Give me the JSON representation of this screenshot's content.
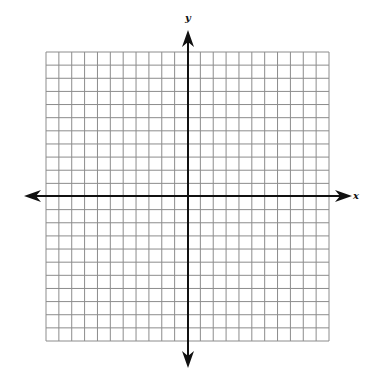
{
  "diagram": {
    "type": "coordinate-plane",
    "grid": {
      "columns": 22,
      "rows": 22,
      "left": 46,
      "top": 52,
      "right": 329,
      "bottom": 341,
      "line_color": "#8c8c8c"
    },
    "axes": {
      "color": "#111111",
      "origin_x": 188,
      "origin_y": 196,
      "x_axis": {
        "label": "x",
        "from": 24,
        "to": 352
      },
      "y_axis": {
        "label": "y",
        "from": 30,
        "to": 368
      }
    }
  }
}
